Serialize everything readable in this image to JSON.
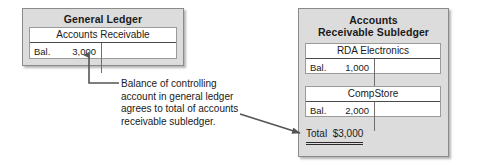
{
  "diagram": {
    "colors": {
      "panel_fill": "#dcdcdc",
      "panel_border": "#8a8a8a",
      "account_fill": "#ffffff",
      "text": "#1a1a1a",
      "connector": "#555555"
    }
  },
  "general_ledger": {
    "title": "General Ledger",
    "account": {
      "name": "Accounts Receivable",
      "entry_label": "Bal.",
      "entry_amount": "3,000"
    }
  },
  "subledger": {
    "title_line1": "Accounts",
    "title_line2": "Receivable Subledger",
    "accounts": [
      {
        "name": "RDA Electronics",
        "entry_label": "Bal.",
        "entry_amount": "1,000"
      },
      {
        "name": "CompStore",
        "entry_label": "Bal.",
        "entry_amount": "2,000"
      }
    ],
    "total": "Total  $3,000"
  },
  "caption": {
    "line1": "Balance of controlling",
    "line2": "account in general ledger",
    "line3": "agrees to total of accounts",
    "line4": "receivable subledger."
  }
}
